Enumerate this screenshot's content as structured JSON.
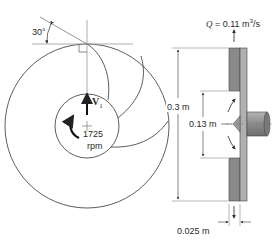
{
  "diagram": {
    "type": "centrifugal-pump-impeller",
    "front_view": {
      "blade_angle_label": "30°",
      "velocity_label": "V",
      "velocity_subscript": "1",
      "speed_value": "1725",
      "speed_unit": "rpm"
    },
    "side_view": {
      "flow_rate_prefix": "Q",
      "flow_rate_value": "= 0.11 m",
      "flow_rate_exp": "3",
      "flow_rate_suffix": "/s",
      "outer_diameter_label": "0.3 m",
      "inner_diameter_label": "0.13 m",
      "blade_width_label": "0.025 m"
    },
    "colors": {
      "line": "#333333",
      "guide_line": "#999999",
      "plate_dark": "#7a7a7a",
      "plate_light": "#a8a8a8",
      "shaft": "#8c8c8c"
    }
  }
}
